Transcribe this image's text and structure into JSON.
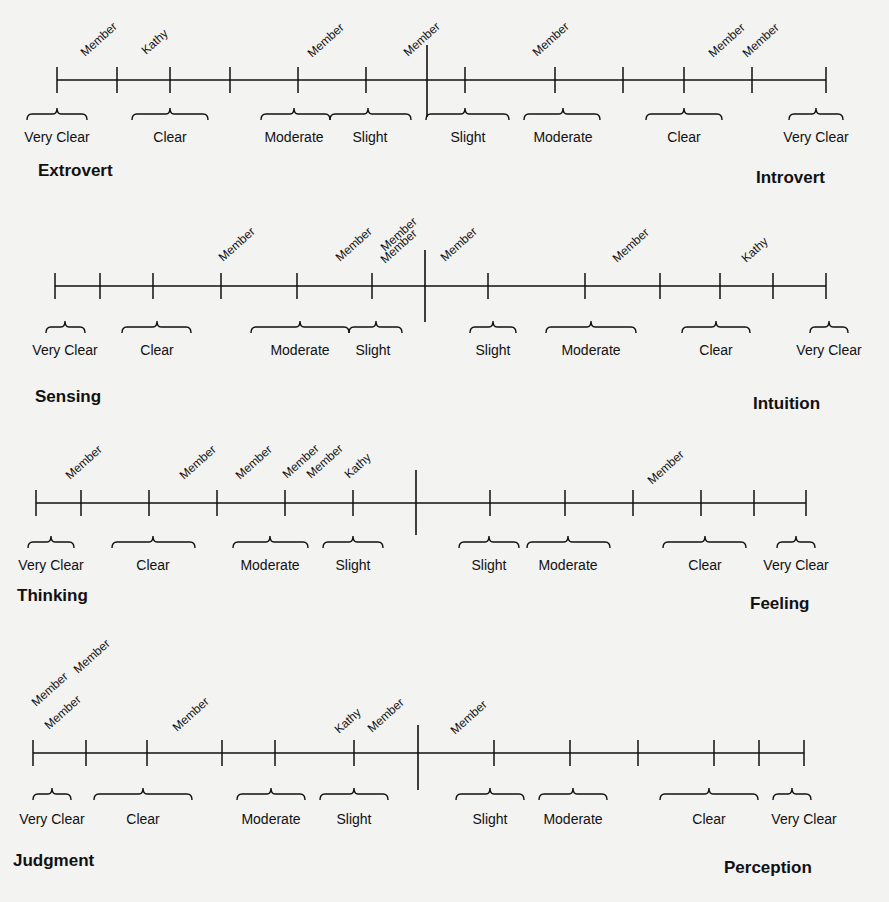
{
  "diagram": {
    "type": "personality-preference-scales",
    "line_color": "#111111",
    "background": "#f3f3f1",
    "scales": [
      {
        "id": "ei",
        "left_pole": "Extrovert",
        "right_pole": "Introvert",
        "line_y": 80,
        "x_start": 57,
        "x_end": 826,
        "center_x": 427,
        "center_top": 45,
        "center_bottom": 117,
        "ticks": [
          57,
          117,
          170,
          230,
          298,
          366,
          465,
          555,
          623,
          684,
          752,
          826
        ],
        "left_pole_pos": {
          "x": 38,
          "y": 176
        },
        "right_pole_pos": {
          "x": 756,
          "y": 183
        },
        "categories": [
          {
            "label": "Very Clear",
            "x1": 27,
            "x2": 87,
            "cx": 57,
            "label_x": 57
          },
          {
            "label": "Clear",
            "x1": 132,
            "x2": 208,
            "cx": 170,
            "label_x": 170
          },
          {
            "label": "Moderate",
            "x1": 261,
            "x2": 330,
            "cx": 294,
            "label_x": 294
          },
          {
            "label": "Slight",
            "x1": 330,
            "x2": 411,
            "cx": 368,
            "label_x": 370
          },
          {
            "label": "Slight",
            "x1": 426,
            "x2": 509,
            "cx": 465,
            "label_x": 468
          },
          {
            "label": "Moderate",
            "x1": 524,
            "x2": 600,
            "cx": 563,
            "label_x": 563
          },
          {
            "label": "Clear",
            "x1": 646,
            "x2": 722,
            "cx": 684,
            "label_x": 684
          },
          {
            "label": "Very Clear",
            "x1": 789,
            "x2": 843,
            "cx": 816,
            "label_x": 816
          }
        ],
        "brace_y": 112,
        "label_y": 142,
        "markers": [
          {
            "label": "Member",
            "x": 85,
            "y": 57
          },
          {
            "label": "Kathy",
            "x": 146,
            "y": 55
          },
          {
            "label": "Member",
            "x": 312,
            "y": 58
          },
          {
            "label": "Member",
            "x": 408,
            "y": 57
          },
          {
            "label": "Member",
            "x": 537,
            "y": 57
          },
          {
            "label": "Member",
            "x": 713,
            "y": 58
          },
          {
            "label": "Member",
            "x": 747,
            "y": 58
          }
        ]
      },
      {
        "id": "sn",
        "left_pole": "Sensing",
        "right_pole": "Intuition",
        "line_y": 286,
        "x_start": 55,
        "x_end": 826,
        "center_x": 425,
        "center_top": 250,
        "center_bottom": 322,
        "ticks": [
          55,
          100,
          153,
          221,
          297,
          372,
          488,
          585,
          660,
          720,
          773,
          826
        ],
        "left_pole_pos": {
          "x": 35,
          "y": 402
        },
        "right_pole_pos": {
          "x": 753,
          "y": 409
        },
        "categories": [
          {
            "label": "Very Clear",
            "x1": 46,
            "x2": 85,
            "cx": 65,
            "label_x": 65
          },
          {
            "label": "Clear",
            "x1": 122,
            "x2": 191,
            "cx": 157,
            "label_x": 157
          },
          {
            "label": "Moderate",
            "x1": 251,
            "x2": 349,
            "cx": 300,
            "label_x": 300
          },
          {
            "label": "Slight",
            "x1": 349,
            "x2": 402,
            "cx": 376,
            "label_x": 373
          },
          {
            "label": "Slight",
            "x1": 470,
            "x2": 516,
            "cx": 493,
            "label_x": 493
          },
          {
            "label": "Moderate",
            "x1": 546,
            "x2": 636,
            "cx": 591,
            "label_x": 591
          },
          {
            "label": "Clear",
            "x1": 682,
            "x2": 750,
            "cx": 716,
            "label_x": 716
          },
          {
            "label": "Very Clear",
            "x1": 810,
            "x2": 848,
            "cx": 829,
            "label_x": 829
          }
        ],
        "brace_y": 325,
        "label_y": 355,
        "markers": [
          {
            "label": "Member",
            "x": 223,
            "y": 262
          },
          {
            "label": "Member",
            "x": 340,
            "y": 262
          },
          {
            "label": "Member",
            "x": 385,
            "y": 252
          },
          {
            "label": "Member",
            "x": 385,
            "y": 264
          },
          {
            "label": "Member",
            "x": 445,
            "y": 262
          },
          {
            "label": "Member",
            "x": 617,
            "y": 263
          },
          {
            "label": "Kathy",
            "x": 746,
            "y": 263
          }
        ]
      },
      {
        "id": "tf",
        "left_pole": "Thinking",
        "right_pole": "Feeling",
        "line_y": 503,
        "x_start": 36,
        "x_end": 806,
        "center_x": 416,
        "center_top": 470,
        "center_bottom": 535,
        "ticks": [
          36,
          81,
          149,
          217,
          285,
          353,
          490,
          565,
          633,
          701,
          754,
          806
        ],
        "left_pole_pos": {
          "x": 17,
          "y": 601
        },
        "right_pole_pos": {
          "x": 750,
          "y": 609
        },
        "categories": [
          {
            "label": "Very Clear",
            "x1": 28,
            "x2": 74,
            "cx": 51,
            "label_x": 51
          },
          {
            "label": "Clear",
            "x1": 112,
            "x2": 195,
            "cx": 153,
            "label_x": 153
          },
          {
            "label": "Moderate",
            "x1": 233,
            "x2": 308,
            "cx": 270,
            "label_x": 270
          },
          {
            "label": "Slight",
            "x1": 323,
            "x2": 383,
            "cx": 353,
            "label_x": 353
          },
          {
            "label": "Slight",
            "x1": 459,
            "x2": 519,
            "cx": 489,
            "label_x": 489
          },
          {
            "label": "Moderate",
            "x1": 527,
            "x2": 610,
            "cx": 568,
            "label_x": 568
          },
          {
            "label": "Clear",
            "x1": 663,
            "x2": 746,
            "cx": 705,
            "label_x": 705
          },
          {
            "label": "Very Clear",
            "x1": 777,
            "x2": 815,
            "cx": 796,
            "label_x": 796
          }
        ],
        "brace_y": 540,
        "label_y": 570,
        "markers": [
          {
            "label": "Member",
            "x": 70,
            "y": 480
          },
          {
            "label": "Member",
            "x": 184,
            "y": 480
          },
          {
            "label": "Member",
            "x": 240,
            "y": 480
          },
          {
            "label": "Member",
            "x": 287,
            "y": 479
          },
          {
            "label": "Member",
            "x": 311,
            "y": 479
          },
          {
            "label": "Kathy",
            "x": 349,
            "y": 479
          },
          {
            "label": "Member",
            "x": 652,
            "y": 485
          }
        ]
      },
      {
        "id": "jp",
        "left_pole": "Judgment",
        "right_pole": "Perception",
        "line_y": 753,
        "x_start": 33,
        "x_end": 804,
        "center_x": 418,
        "center_top": 725,
        "center_bottom": 790,
        "ticks": [
          33,
          86,
          147,
          222,
          275,
          354,
          494,
          570,
          638,
          714,
          759,
          804
        ],
        "left_pole_pos": {
          "x": 13,
          "y": 866
        },
        "right_pole_pos": {
          "x": 724,
          "y": 873
        },
        "categories": [
          {
            "label": "Very Clear",
            "x1": 33,
            "x2": 71,
            "cx": 52,
            "label_x": 52
          },
          {
            "label": "Clear",
            "x1": 94,
            "x2": 192,
            "cx": 143,
            "label_x": 143
          },
          {
            "label": "Moderate",
            "x1": 237,
            "x2": 305,
            "cx": 271,
            "label_x": 271
          },
          {
            "label": "Slight",
            "x1": 320,
            "x2": 388,
            "cx": 354,
            "label_x": 354
          },
          {
            "label": "Slight",
            "x1": 456,
            "x2": 524,
            "cx": 490,
            "label_x": 490
          },
          {
            "label": "Moderate",
            "x1": 539,
            "x2": 607,
            "cx": 573,
            "label_x": 573
          },
          {
            "label": "Clear",
            "x1": 660,
            "x2": 758,
            "cx": 709,
            "label_x": 709
          },
          {
            "label": "Very Clear",
            "x1": 773,
            "x2": 811,
            "cx": 792,
            "label_x": 804
          }
        ],
        "brace_y": 792,
        "label_y": 824,
        "markers": [
          {
            "label": "Member",
            "x": 36,
            "y": 707
          },
          {
            "label": "Member",
            "x": 78,
            "y": 674
          },
          {
            "label": "Member",
            "x": 49,
            "y": 730
          },
          {
            "label": "Member",
            "x": 177,
            "y": 732
          },
          {
            "label": "Kathy",
            "x": 339,
            "y": 734
          },
          {
            "label": "Member",
            "x": 372,
            "y": 733
          },
          {
            "label": "Member",
            "x": 455,
            "y": 735
          }
        ]
      }
    ]
  }
}
